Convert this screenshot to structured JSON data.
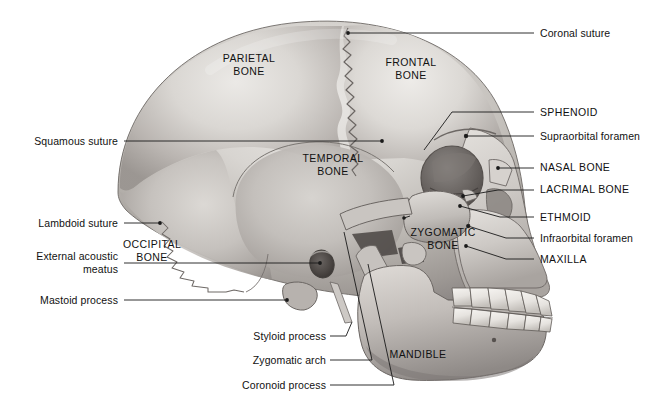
{
  "figure": {
    "background_color": "#ffffff",
    "line_color": "#1a1a1a",
    "text_color": "#111111"
  },
  "bone_labels": [
    {
      "id": "parietal",
      "text": "PARIETAL\nBONE",
      "x": 248,
      "y": 52
    },
    {
      "id": "frontal",
      "text": "FRONTAL\nBONE",
      "x": 410,
      "y": 56
    },
    {
      "id": "temporal",
      "text": "TEMPORAL\nBONE",
      "x": 333,
      "y": 152
    },
    {
      "id": "occipital",
      "text": "OCCIPITAL\nBONE",
      "x": 152,
      "y": 238
    },
    {
      "id": "zygomatic",
      "text": "ZYGOMATIC\nBONE",
      "x": 443,
      "y": 226
    },
    {
      "id": "mandible",
      "text": "MANDIBLE",
      "x": 417,
      "y": 348
    }
  ],
  "callouts_left": [
    {
      "id": "squamous-suture",
      "text": "Squamous suture",
      "text_x": 118,
      "text_y": 136,
      "line": "M124,141 L382,141",
      "dot": [
        382,
        141
      ]
    },
    {
      "id": "lambdoid-suture",
      "text": "Lambdoid suture",
      "text_x": 118,
      "text_y": 218,
      "line": "M124,223 L160,223",
      "dot": [
        160,
        223
      ]
    },
    {
      "id": "external-acoustic-meatus",
      "text": "External acoustic\nmeatus",
      "text_x": 118,
      "text_y": 257,
      "line": "M124,263 L320,263",
      "dot": [
        320,
        263
      ]
    },
    {
      "id": "mastoid-process",
      "text": "Mastoid process",
      "text_x": 118,
      "text_y": 295,
      "line": "M124,300 L287,300",
      "dot": [
        287,
        300
      ]
    }
  ],
  "callouts_bottom": [
    {
      "id": "styloid-process",
      "text": "Styloid process",
      "text_x": 326,
      "text_y": 331,
      "line": "M332,336 L352,325 L352,325"
    },
    {
      "id": "zygomatic-arch",
      "text": "Zygomatic arch",
      "text_x": 326,
      "text_y": 355,
      "line": "M332,360 L398,360 L340,300"
    },
    {
      "id": "coronoid-process",
      "text": "Coronoid process",
      "text_x": 326,
      "text_y": 380,
      "line": "M332,385 L410,385 L358,292"
    }
  ],
  "callouts_right": [
    {
      "id": "coronal-suture",
      "text": "Coronal suture",
      "text_x": 540,
      "text_y": 33,
      "line": "M348,33 L534,33",
      "dot": [
        348,
        33
      ]
    },
    {
      "id": "sphenoid",
      "text": "SPHENOID",
      "text_x": 540,
      "text_y": 112,
      "line": "M446,112 L534,112",
      "dot": null,
      "elbow": "M446,112 L455,112 L424,147"
    },
    {
      "id": "supraorbital-foramen",
      "text": "Supraorbital foramen",
      "text_x": 540,
      "text_y": 136,
      "line": "M466,136 L534,136",
      "dot": [
        466,
        136
      ]
    },
    {
      "id": "nasal-bone",
      "text": "NASAL BONE",
      "text_x": 540,
      "text_y": 167,
      "line": "M497,167 L534,167",
      "dot": [
        497,
        167
      ]
    },
    {
      "id": "lacrimal-bone",
      "text": "LACRIMAL BONE",
      "text_x": 540,
      "text_y": 188,
      "line": "M463,196 L490,188 L534,188",
      "dot": [
        463,
        196
      ]
    },
    {
      "id": "ethmoid",
      "text": "ETHMOID",
      "text_x": 540,
      "text_y": 216,
      "line": "M462,205 L500,216 L534,216",
      "dot": [
        462,
        205
      ]
    },
    {
      "id": "infraorbital-foramen",
      "text": "Infraorbital foramen",
      "text_x": 540,
      "text_y": 237,
      "line": "M468,226 L505,237 L534,237",
      "dot": [
        468,
        226
      ]
    },
    {
      "id": "maxilla",
      "text": "MAXILLA",
      "text_x": 540,
      "text_y": 258,
      "line": "M466,245 L505,258 L534,258",
      "dot": [
        466,
        245
      ]
    }
  ],
  "anatomy_notes": {
    "view": "left lateral",
    "structures_depicted": [
      "cranial vault",
      "orbit",
      "nasal aperture",
      "zygomatic arch",
      "external acoustic meatus",
      "mastoid process",
      "styloid process",
      "mandible with coronoid process",
      "upper and lower dentition"
    ]
  }
}
